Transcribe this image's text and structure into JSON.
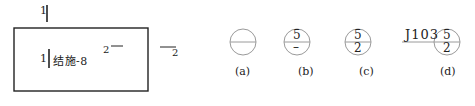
{
  "figure": {
    "left_panel": {
      "top_marker": "1",
      "box_label_prefix": "1",
      "box_label": "结施-8",
      "inner_number": "2",
      "outer_number": "2"
    },
    "symbols": [
      {
        "id": "a",
        "caption": "(a)",
        "top": "",
        "bottom": "",
        "prefix": ""
      },
      {
        "id": "b",
        "caption": "(b)",
        "top": "5",
        "bottom": "–",
        "prefix": ""
      },
      {
        "id": "c",
        "caption": "(c)",
        "top": "5",
        "bottom": "2",
        "prefix": ""
      },
      {
        "id": "d",
        "caption": "(d)",
        "top": "5",
        "bottom": "2",
        "prefix": "J103"
      }
    ],
    "colors": {
      "line": "#222222",
      "circle": "#9a9a9a"
    }
  }
}
